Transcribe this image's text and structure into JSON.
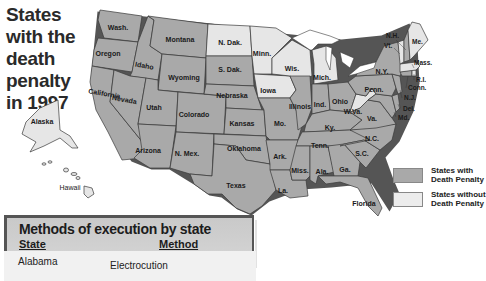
{
  "title": "States with the death penalty in 1997",
  "legend": {
    "with": {
      "label": "States with Death Penalty",
      "color": "#a9a9a9"
    },
    "without": {
      "label": "States without Death Penalty",
      "color": "#e6e6e6"
    }
  },
  "states_with_death_penalty": [
    "Wash.",
    "Oregon",
    "California",
    "Idaho",
    "Nevada",
    "Montana",
    "Wyoming",
    "Utah",
    "Arizona",
    "Colorado",
    "N. Mex.",
    "S. Dak.",
    "Nebraska",
    "Kansas",
    "Oklahoma",
    "Texas",
    "Mo.",
    "Ark.",
    "La.",
    "Illinois",
    "Ind.",
    "Ohio",
    "Ky.",
    "Tenn.",
    "Miss.",
    "Ala.",
    "Ga.",
    "Florida",
    "S.C.",
    "N.C.",
    "Va.",
    "Md.",
    "Del.",
    "Penn.",
    "N.J.",
    "N.Y.",
    "Conn.",
    "N.H."
  ],
  "states_without_death_penalty": [
    "Alaska",
    "Hawaii",
    "N. Dak.",
    "Minn.",
    "Iowa",
    "Wis.",
    "Mich.",
    "W. Va.",
    "Vt.",
    "Me.",
    "Mass.",
    "R.I."
  ],
  "labels": {
    "wash": "Wash.",
    "oregon": "Oregon",
    "california": "California",
    "idaho": "Idaho",
    "nevada": "Nevada",
    "montana": "Montana",
    "wyoming": "Wyoming",
    "utah": "Utah",
    "arizona": "Arizona",
    "colorado": "Colorado",
    "nmex": "N. Mex.",
    "ndak": "N. Dak.",
    "sdak": "S. Dak.",
    "nebraska": "Nebraska",
    "kansas": "Kansas",
    "oklahoma": "Oklahoma",
    "texas": "Texas",
    "minn": "Minn.",
    "iowa": "Iowa",
    "mo": "Mo.",
    "ark": "Ark.",
    "la": "La.",
    "wis": "Wis.",
    "illinois": "Illinois",
    "mich": "Mich.",
    "ind": "Ind.",
    "ohio": "Ohio",
    "ky": "Ky.",
    "tenn": "Tenn.",
    "miss": "Miss.",
    "ala": "Ala.",
    "ga": "Ga.",
    "florida": "Florida",
    "sc": "S.C.",
    "nc": "N.C.",
    "va": "Va.",
    "wva": "W.Va.",
    "md": "Md.",
    "del": "Del.",
    "penn": "Penn.",
    "nj": "N.J.",
    "ny": "N.Y.",
    "conn": "Conn.",
    "ri": "R.I.",
    "mass": "Mass.",
    "vt": "Vt.",
    "nh": "N.H.",
    "me": "Me.",
    "alaska": "Alaska",
    "hawaii": "Hawaii"
  },
  "methods_table": {
    "title": "Methods of execution by state",
    "headers": {
      "state": "State",
      "method": "Method"
    },
    "rows": [
      {
        "state": "Alabama",
        "method": "Electrocution"
      }
    ]
  }
}
